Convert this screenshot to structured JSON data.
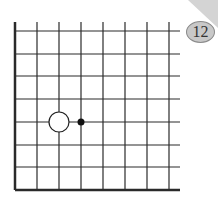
{
  "diagram": {
    "type": "go-board-corner",
    "problem_number": "12",
    "grid": {
      "vertical_lines_x": [
        15,
        37,
        59,
        81,
        103,
        125,
        147,
        169
      ],
      "horizontal_lines_y": [
        31,
        54,
        76,
        99,
        122,
        145,
        167,
        190
      ],
      "line_end_x": 180,
      "line_start_y": 22,
      "edges": [
        "left",
        "bottom"
      ]
    },
    "stones": [
      {
        "color": "white",
        "col": 2,
        "row": 4,
        "label": "white stone"
      },
      {
        "color": "black-marker",
        "col": 3,
        "row": 4,
        "label": "small black dot marker"
      }
    ],
    "colors": {
      "line": "#2a2a2a",
      "badge_fill": "#c8c8c8",
      "corner_fold": "#d4d4d4"
    }
  }
}
